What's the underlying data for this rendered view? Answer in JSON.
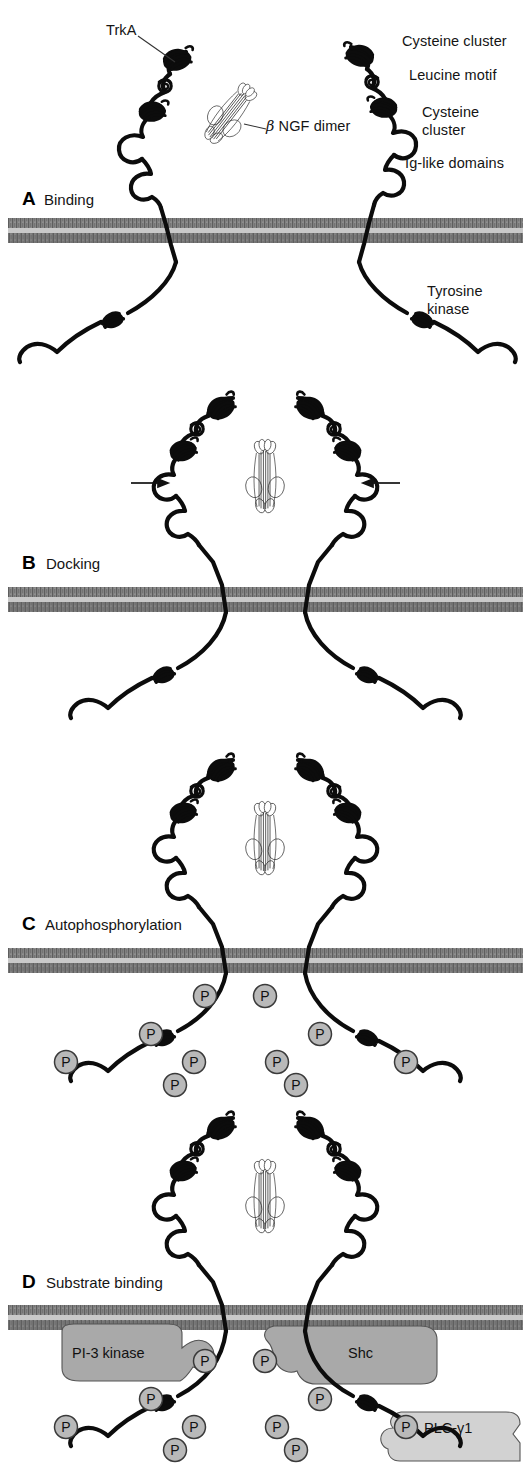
{
  "figure": {
    "width": 531,
    "height": 1463
  },
  "colors": {
    "ink": "#111111",
    "stroke_black": "#0c0c0c",
    "membrane_dark": "#7d7d7d",
    "membrane_light": "#c9c9c9",
    "phospho_fill": "#b9b9b9",
    "phospho_stroke": "#3a3a3a",
    "substrate_gray": "#a9a9a9",
    "substrate_light_gray": "#d2d2d2",
    "background": "#ffffff"
  },
  "panels": [
    {
      "id": "A",
      "letter": "A",
      "caption": "Binding",
      "state": "two separate receptors flanking a free ligand",
      "membrane_y": 218,
      "phospho_count": 0,
      "arrows": 0,
      "substrates": []
    },
    {
      "id": "B",
      "letter": "B",
      "caption": "Docking",
      "state": "receptor dimer closing around ligand",
      "membrane_y": 587,
      "phospho_count": 0,
      "arrows": 2,
      "substrates": []
    },
    {
      "id": "C",
      "letter": "C",
      "caption": "Autophosphorylation",
      "state": "dimerized receptor with phosphorylated tails",
      "membrane_y": 948,
      "phospho_count": 10,
      "arrows": 0,
      "substrates": []
    },
    {
      "id": "D",
      "letter": "D",
      "caption": "Substrate binding",
      "state": "phosphotyrosines recruit signaling proteins",
      "membrane_y": 1305,
      "phospho_count": 10,
      "arrows": 0,
      "substrates": [
        "PI-3 kinase",
        "Shc",
        "PLC-γ1"
      ]
    }
  ],
  "annotations": {
    "trka": "TrkA",
    "ngf_beta": "β",
    "ngf_rest": " NGF dimer",
    "cysteine_cluster_1": "Cysteine cluster",
    "leucine_motif": "Leucine motif",
    "cysteine_cluster_2_line1": "Cysteine",
    "cysteine_cluster_2_line2": "cluster",
    "ig_like_domains": "Ig-like domains",
    "tyrosine_kinase_line1": "Tyrosine",
    "tyrosine_kinase_line2": "kinase"
  },
  "substrate_labels": {
    "pi3_kinase": "PI-3 kinase",
    "shc": "Shc",
    "plc_gamma1": "PLC-γ1"
  },
  "phospho": {
    "glyph": "P",
    "radius": 11.5,
    "panel_c_positions": [
      {
        "x": 205,
        "y": 996
      },
      {
        "x": 265,
        "y": 996
      },
      {
        "x": 151,
        "y": 1034
      },
      {
        "x": 320,
        "y": 1034
      },
      {
        "x": 66,
        "y": 1062
      },
      {
        "x": 406,
        "y": 1062
      },
      {
        "x": 194,
        "y": 1062
      },
      {
        "x": 277,
        "y": 1062
      },
      {
        "x": 175,
        "y": 1085
      },
      {
        "x": 296,
        "y": 1085
      }
    ],
    "panel_d_positions": [
      {
        "x": 205,
        "y": 1361
      },
      {
        "x": 265,
        "y": 1361
      },
      {
        "x": 151,
        "y": 1399
      },
      {
        "x": 320,
        "y": 1399
      },
      {
        "x": 66,
        "y": 1427
      },
      {
        "x": 406,
        "y": 1427
      },
      {
        "x": 194,
        "y": 1427
      },
      {
        "x": 277,
        "y": 1427
      },
      {
        "x": 175,
        "y": 1450
      },
      {
        "x": 296,
        "y": 1450
      }
    ]
  },
  "receptor_domains": [
    "Cysteine cluster",
    "Leucine motif",
    "Cysteine cluster",
    "Ig-like domains",
    "Transmembrane",
    "Tyrosine kinase"
  ]
}
